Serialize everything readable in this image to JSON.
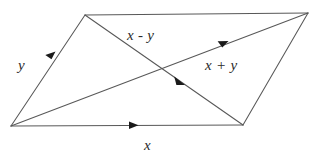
{
  "figure": {
    "background_color": "#ffffff",
    "line_color": "#585858",
    "arrow_color": "#1a1a1a",
    "label_color": "#2b2b2b",
    "labels": {
      "side_bottom": "x",
      "side_left": "y",
      "diagonal_sum": "x + y",
      "diagonal_difference": "x - y"
    },
    "vertices": {
      "bottom_left": "11,126",
      "top_left": "85,15",
      "top_right": "308,13",
      "bottom_right": "243,125"
    },
    "arrow_positions": {
      "side_bottom": "133,125",
      "side_left": "52,56",
      "diagonal_sum": "223,43",
      "diagonal_difference": "180,81"
    }
  }
}
